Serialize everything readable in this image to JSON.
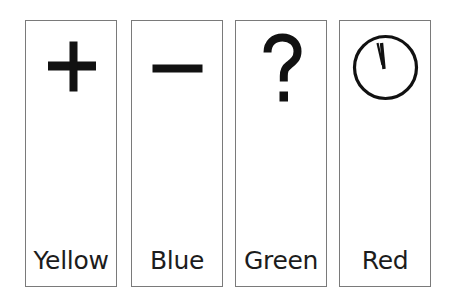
{
  "cards": [
    {
      "id": "yellow",
      "symbol": "plus-icon",
      "symbol_glyph": "+",
      "label": "Yellow",
      "left": 25
    },
    {
      "id": "blue",
      "symbol": "minus-icon",
      "symbol_glyph": "−",
      "label": "Blue",
      "left": 131
    },
    {
      "id": "green",
      "symbol": "question-mark-icon",
      "symbol_glyph": "?",
      "label": "Green",
      "left": 235
    },
    {
      "id": "red",
      "symbol": "clock-icon",
      "symbol_glyph": "🕐",
      "label": "Red",
      "left": 339
    }
  ],
  "colors": {
    "border": "#7a7a7a",
    "symbol": "#111111",
    "text": "#1c1c1c",
    "background": "#ffffff"
  }
}
